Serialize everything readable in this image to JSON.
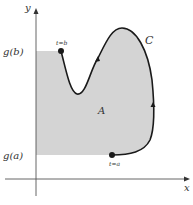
{
  "axes": {
    "x_label": "x",
    "y_label": "y"
  },
  "levels": {
    "upper": "g(b)",
    "lower": "g(a)"
  },
  "curve": {
    "label": "C",
    "start_label": "t=a",
    "end_label": "t=b"
  },
  "region": {
    "label": "A"
  },
  "colors": {
    "shade": "#d4d4d4",
    "curve": "#1a1a1a",
    "axis": "#555555"
  }
}
